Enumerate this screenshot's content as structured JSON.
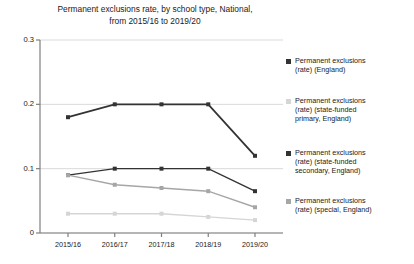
{
  "chart_data": {
    "type": "line",
    "title": "Permanent exclusions rate, by school type, National,\nfrom 2015/16 to 2019/20",
    "xlabel": "",
    "ylabel": "",
    "categories": [
      "2015/16",
      "2016/17",
      "2017/18",
      "2018/19",
      "2019/20"
    ],
    "ylim": [
      0,
      0.3
    ],
    "yticks": [
      "0",
      "0.1",
      "0.2",
      "0.3"
    ],
    "ytick_values": [
      0,
      0.1,
      0.2,
      0.3
    ],
    "grid": "horizontal",
    "legend_position": "right",
    "series": [
      {
        "name": "Permanent exclusions (rate) (England)",
        "label": "Permanent exclusions\n(rate) (England)",
        "color": "#333333",
        "values": [
          0.18,
          0.2,
          0.2,
          0.2,
          0.12
        ]
      },
      {
        "name": "Permanent exclusions (rate) (state-funded primary, England)",
        "label": "Permanent exclusions\n(rate) (state-funded\nprimary, England)",
        "color": "#d5d5d5",
        "values": [
          0.03,
          0.03,
          0.03,
          0.025,
          0.02
        ]
      },
      {
        "name": "Permanent exclusions (rate) (state-funded secondary, England)",
        "label": "Permanent exclusions\n(rate) (state-funded\nsecondary, England)",
        "color": "#333333",
        "values": [
          0.09,
          0.1,
          0.1,
          0.1,
          0.065
        ]
      },
      {
        "name": "Permanent exclusions (rate) (special, England)",
        "label": "Permanent exclusions\n(rate) (special, England)",
        "color": "#a6a6a6",
        "values": [
          0.09,
          0.075,
          0.07,
          0.065,
          0.04
        ]
      }
    ]
  },
  "colors": {
    "axis": "#7f7f7f",
    "grid": "#d9d9d9",
    "text": "#1a1a1a",
    "background": "#ffffff"
  }
}
